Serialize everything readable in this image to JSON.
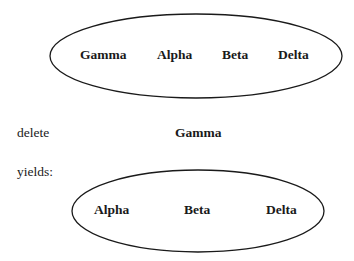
{
  "set_before": {
    "items": [
      "Gamma",
      "Alpha",
      "Beta",
      "Delta"
    ]
  },
  "operation": {
    "verb": "delete",
    "operand": "Gamma"
  },
  "result_label": "yields:",
  "set_after": {
    "items": [
      "Alpha",
      "Beta",
      "Delta"
    ]
  }
}
